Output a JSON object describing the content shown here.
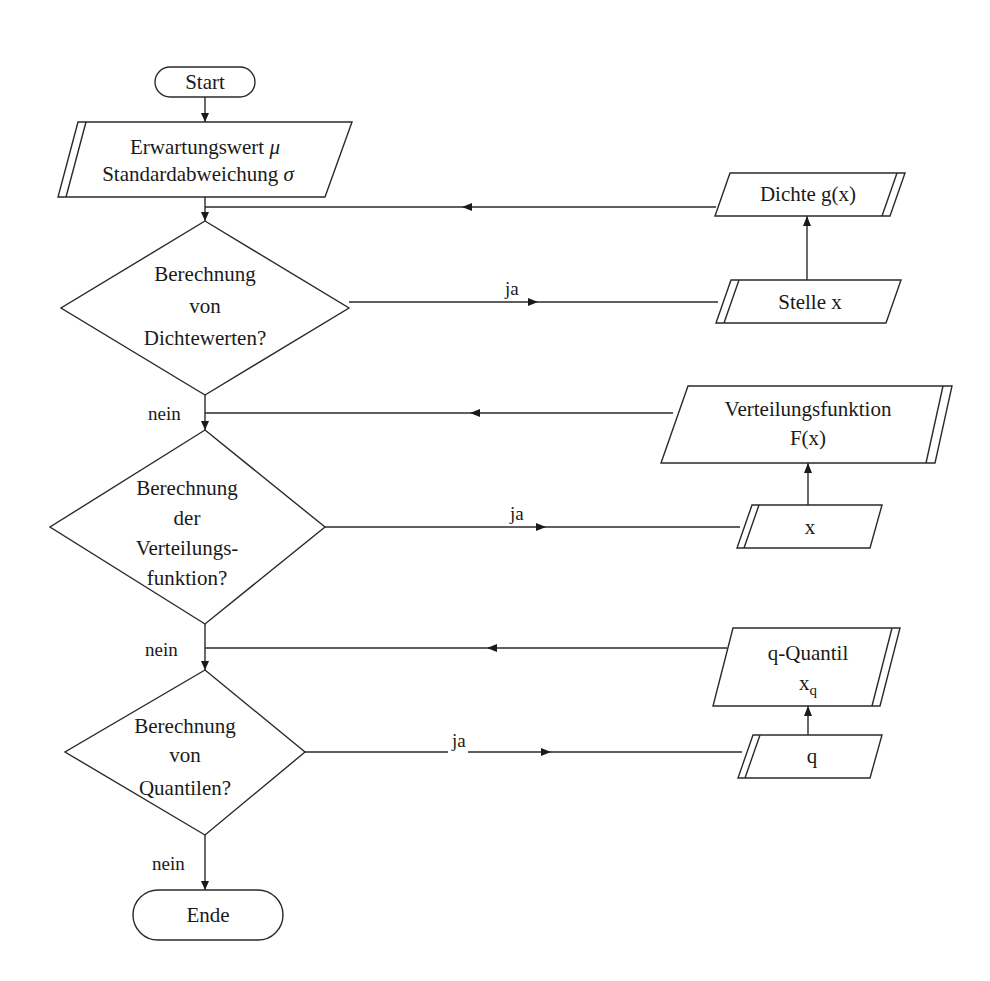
{
  "diagram": {
    "type": "flowchart",
    "language": "de",
    "nodes": {
      "start": {
        "kind": "terminal",
        "label": "Start"
      },
      "input_params": {
        "kind": "input",
        "lines": [
          "Erwartungswert",
          "Standardabweichung"
        ],
        "symbols": [
          "μ",
          "σ"
        ]
      },
      "decision_density": {
        "kind": "decision",
        "lines": [
          "Berechnung",
          "von",
          "Dichtewerten?"
        ]
      },
      "input_position": {
        "kind": "input",
        "label": "Stelle x"
      },
      "output_density": {
        "kind": "output",
        "label": "Dichte g(x)"
      },
      "decision_cdf": {
        "kind": "decision",
        "lines": [
          "Berechnung",
          "der",
          "Verteilungs-",
          "funktion?"
        ]
      },
      "input_x": {
        "kind": "input",
        "label": "x"
      },
      "output_cdf": {
        "kind": "output",
        "lines": [
          "Verteilungsfunktion",
          "F(x)"
        ]
      },
      "decision_quantile": {
        "kind": "decision",
        "lines": [
          "Berechnung",
          "von",
          "Quantilen?"
        ]
      },
      "input_q": {
        "kind": "input",
        "label": "q"
      },
      "output_quantile": {
        "kind": "output",
        "lines": [
          "q-Quantil",
          "x"
        ],
        "subscript": "q"
      },
      "end": {
        "kind": "terminal",
        "label": "Ende"
      }
    },
    "edge_labels": {
      "yes": "ja",
      "no": "nein"
    },
    "edges": [
      {
        "from": "start",
        "to": "input_params"
      },
      {
        "from": "input_params",
        "to": "decision_density"
      },
      {
        "from": "decision_density",
        "to": "input_position",
        "label": "ja"
      },
      {
        "from": "input_position",
        "to": "output_density"
      },
      {
        "from": "output_density",
        "to": "decision_density"
      },
      {
        "from": "decision_density",
        "to": "decision_cdf",
        "label": "nein"
      },
      {
        "from": "decision_cdf",
        "to": "input_x",
        "label": "ja"
      },
      {
        "from": "input_x",
        "to": "output_cdf"
      },
      {
        "from": "output_cdf",
        "to": "decision_cdf"
      },
      {
        "from": "decision_cdf",
        "to": "decision_quantile",
        "label": "nein"
      },
      {
        "from": "decision_quantile",
        "to": "input_q",
        "label": "ja"
      },
      {
        "from": "input_q",
        "to": "output_quantile"
      },
      {
        "from": "output_quantile",
        "to": "decision_quantile"
      },
      {
        "from": "decision_quantile",
        "to": "end",
        "label": "nein"
      }
    ]
  }
}
